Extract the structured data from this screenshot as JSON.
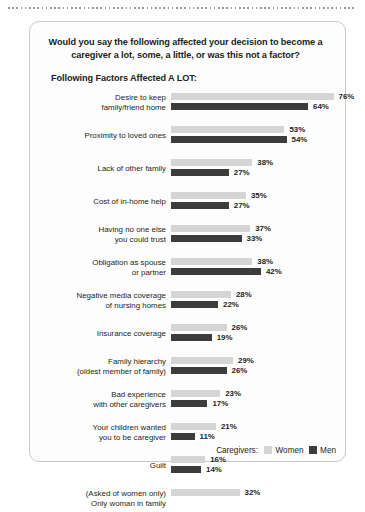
{
  "question": "Would you say the following affected your decision to become a caregiver a lot, some, a little, or was this not a factor?",
  "subtitle": "Following Factors Affected A LOT:",
  "legend": {
    "title": "Caregivers:",
    "women_label": "Women",
    "men_label": "Men",
    "women_color": "#d5d5d5",
    "men_color": "#3c3c3c"
  },
  "rows": [
    {
      "label_line1": "Desire to keep",
      "label_line2": "family/friend home",
      "women": 76,
      "men": 64,
      "women_text": "76%",
      "men_text": "64%"
    },
    {
      "label_line1": "Proximity to loved ones",
      "label_line2": "",
      "women": 53,
      "men": 54,
      "women_text": "53%",
      "men_text": "54%"
    },
    {
      "label_line1": "Lack of other family",
      "label_line2": "",
      "women": 38,
      "men": 27,
      "women_text": "38%",
      "men_text": "27%"
    },
    {
      "label_line1": "Cost of in-home help",
      "label_line2": "",
      "women": 35,
      "men": 27,
      "women_text": "35%",
      "men_text": "27%"
    },
    {
      "label_line1": "Having no one else",
      "label_line2": "you could trust",
      "women": 37,
      "men": 33,
      "women_text": "37%",
      "men_text": "33%"
    },
    {
      "label_line1": "Obligation as spouse",
      "label_line2": "or partner",
      "women": 38,
      "men": 42,
      "women_text": "38%",
      "men_text": "42%"
    },
    {
      "label_line1": "Negative media coverage",
      "label_line2": "of nursing homes",
      "women": 28,
      "men": 22,
      "women_text": "28%",
      "men_text": "22%"
    },
    {
      "label_line1": "Insurance coverage",
      "label_line2": "",
      "women": 26,
      "men": 19,
      "women_text": "26%",
      "men_text": "19%"
    },
    {
      "label_line1": "Family hierarchy",
      "label_line2": "(oldest member of family)",
      "women": 29,
      "men": 26,
      "women_text": "29%",
      "men_text": "26%"
    },
    {
      "label_line1": "Bad experience",
      "label_line2": "with other caregivers",
      "women": 23,
      "men": 17,
      "women_text": "23%",
      "men_text": "17%"
    },
    {
      "label_line1": "Your children wanted",
      "label_line2": "you to be caregiver",
      "women": 21,
      "men": 11,
      "women_text": "21%",
      "men_text": "11%"
    },
    {
      "label_line1": "Guilt",
      "label_line2": "",
      "women": 16,
      "men": 14,
      "women_text": "16%",
      "men_text": "14%"
    },
    {
      "label_line1": "(Asked of women only)",
      "label_line2": "Only woman in family",
      "women": 32,
      "men": null,
      "women_text": "32%",
      "men_text": ""
    }
  ],
  "chart_data": {
    "type": "bar",
    "title": "Following Factors Affected A LOT:",
    "subtitle": "Would you say the following affected your decision to become a caregiver a lot, some, a little, or was this not a factor?",
    "orientation": "horizontal",
    "xlabel": "",
    "ylabel": "",
    "xlim": [
      0,
      80
    ],
    "grid": false,
    "legend_position": "bottom-right",
    "value_format": "percent",
    "categories": [
      "Desire to keep family/friend home",
      "Proximity to loved ones",
      "Lack of other family",
      "Cost of in-home help",
      "Having no one else you could trust",
      "Obligation as spouse or partner",
      "Negative media coverage of nursing homes",
      "Insurance coverage",
      "Family hierarchy (oldest member of family)",
      "Bad experience with other caregivers",
      "Your children wanted you to be caregiver",
      "Guilt",
      "(Asked of women only) Only woman in family"
    ],
    "series": [
      {
        "name": "Women",
        "color": "#d5d5d5",
        "values": [
          76,
          53,
          38,
          35,
          37,
          38,
          28,
          26,
          29,
          23,
          21,
          16,
          32
        ]
      },
      {
        "name": "Men",
        "color": "#3c3c3c",
        "values": [
          64,
          54,
          27,
          27,
          33,
          42,
          22,
          19,
          26,
          17,
          11,
          14,
          null
        ]
      }
    ],
    "annotations": [
      "Last category asked of women only; no Men value shown."
    ]
  }
}
